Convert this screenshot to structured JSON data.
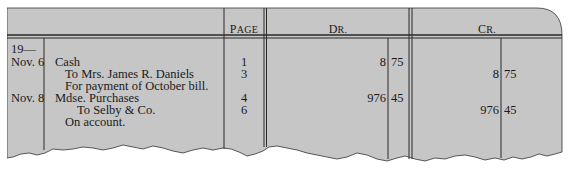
{
  "colors": {
    "paper": "#c8c8c8",
    "rule": "#2a2a2a",
    "text": "#1a1a1a",
    "background": "#ffffff"
  },
  "header": {
    "page": {
      "first": "P",
      "rest": "AGE"
    },
    "debit": {
      "first": "D",
      "rest": "R."
    },
    "credit": {
      "first": "C",
      "rest": "R."
    }
  },
  "year": "19—",
  "entries": [
    {
      "date": "Nov. 6",
      "lines": [
        {
          "text": "Cash",
          "indent": 0,
          "page": "1",
          "dr_dollars": "8",
          "dr_cents": "75",
          "cr_dollars": "",
          "cr_cents": ""
        },
        {
          "text": "To Mrs. James R. Daniels",
          "indent": 1,
          "page": "3",
          "dr_dollars": "",
          "dr_cents": "",
          "cr_dollars": "8",
          "cr_cents": "75"
        },
        {
          "text": "For payment of October bill.",
          "indent": 1,
          "page": "",
          "dr_dollars": "",
          "dr_cents": "",
          "cr_dollars": "",
          "cr_cents": ""
        }
      ]
    },
    {
      "date": "Nov. 8",
      "lines": [
        {
          "text": "Mdse. Purchases",
          "indent": 0,
          "page": "4",
          "dr_dollars": "976",
          "dr_cents": "45",
          "cr_dollars": "",
          "cr_cents": ""
        },
        {
          "text": "To Selby & Co.",
          "indent": 2,
          "page": "6",
          "dr_dollars": "",
          "dr_cents": "",
          "cr_dollars": "976",
          "cr_cents": "45"
        },
        {
          "text": "On account.",
          "indent": 1,
          "page": "",
          "dr_dollars": "",
          "dr_cents": "",
          "cr_dollars": "",
          "cr_cents": ""
        }
      ]
    }
  ]
}
